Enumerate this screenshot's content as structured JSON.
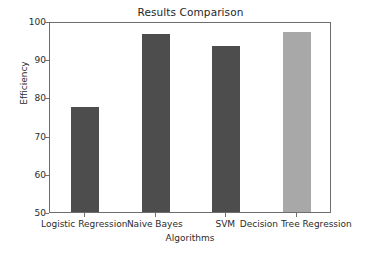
{
  "chart_data": {
    "type": "bar",
    "title": "Results Comparison",
    "xlabel": "Algorithms",
    "ylabel": "Efficiency",
    "categories": [
      "Logistic Regression",
      "Naive Bayes",
      "SVM",
      "Decision Tree Regression"
    ],
    "values": [
      77.5,
      96.5,
      93.4,
      97.2
    ],
    "ylim": [
      50,
      100
    ],
    "yticks": [
      50,
      60,
      70,
      80,
      90,
      100
    ],
    "ytick_labels": [
      "50",
      "60",
      "70",
      "80",
      "90",
      "100"
    ],
    "grid": false,
    "legend": "none",
    "bar_colors": [
      "#4d4d4d",
      "#4d4d4d",
      "#4d4d4d",
      "#a8a8a8"
    ]
  },
  "figure": {
    "background_color": "#ffffff",
    "frame_color": "#6e6e6e",
    "text_color": "#2b2b2b"
  }
}
